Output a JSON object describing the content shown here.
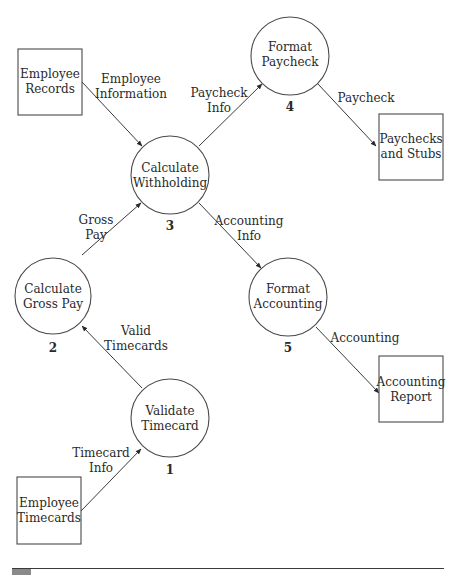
{
  "diagram": {
    "type": "data-flow-diagram",
    "processes": [
      {
        "id": "1",
        "number": "1",
        "line1": "Validate",
        "line2": "Timecard"
      },
      {
        "id": "2",
        "number": "2",
        "line1": "Calculate",
        "line2": "Gross Pay"
      },
      {
        "id": "3",
        "number": "3",
        "line1": "Calculate",
        "line2": "Withholding"
      },
      {
        "id": "4",
        "number": "4",
        "line1": "Format",
        "line2": "Paycheck"
      },
      {
        "id": "5",
        "number": "5",
        "line1": "Format",
        "line2": "Accounting"
      }
    ],
    "entities": [
      {
        "id": "employee-records",
        "line1": "Employee",
        "line2": "Records"
      },
      {
        "id": "paychecks-and-stubs",
        "line1": "Paychecks",
        "line2": "and Stubs"
      },
      {
        "id": "accounting-report",
        "line1": "Accounting",
        "line2": "Report"
      },
      {
        "id": "employee-timecards",
        "line1": "Employee",
        "line2": "Timecards"
      }
    ],
    "flows": [
      {
        "from": "employee-records",
        "to": "3",
        "line1": "Employee",
        "line2": "Information"
      },
      {
        "from": "3",
        "to": "4",
        "line1": "Paycheck",
        "line2": "Info"
      },
      {
        "from": "4",
        "to": "paychecks-and-stubs",
        "line1": "Paycheck",
        "line2": ""
      },
      {
        "from": "2",
        "to": "3",
        "line1": "Gross",
        "line2": "Pay"
      },
      {
        "from": "3",
        "to": "5",
        "line1": "Accounting",
        "line2": "Info"
      },
      {
        "from": "1",
        "to": "2",
        "line1": "Valid",
        "line2": "Timecards"
      },
      {
        "from": "5",
        "to": "accounting-report",
        "line1": "Accounting",
        "line2": ""
      },
      {
        "from": "employee-timecards",
        "to": "1",
        "line1": "Timecard",
        "line2": "Info"
      }
    ]
  }
}
